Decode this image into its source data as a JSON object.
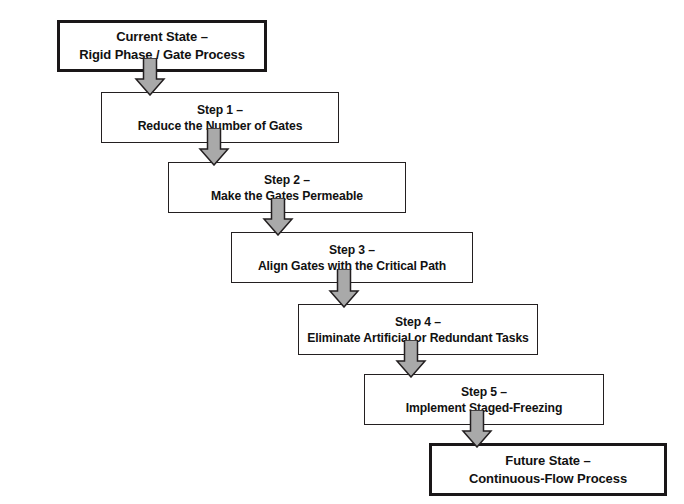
{
  "diagram": {
    "type": "flowchart",
    "orientation": "vertical-cascading",
    "title": "",
    "colors": {
      "box_border": "#231f20",
      "box_fill": "#ffffff",
      "arrow_fill": "#a9a9a9",
      "arrow_stroke": "#231f20",
      "text": "#111111",
      "background": "#ffffff"
    },
    "nodes": [
      {
        "id": "current-state",
        "emphasis": true,
        "line1": "Current State –",
        "line2": "Rigid Phase / Gate Process",
        "x": 57,
        "y": 20,
        "w": 210,
        "h": 52
      },
      {
        "id": "step-1",
        "emphasis": false,
        "line1": "Step 1 –",
        "line2": "Reduce the Number of Gates",
        "x": 101,
        "y": 92,
        "w": 238,
        "h": 51
      },
      {
        "id": "step-2",
        "emphasis": false,
        "line1": "Step 2 –",
        "line2": "Make the Gates Permeable",
        "x": 168,
        "y": 162,
        "w": 238,
        "h": 51
      },
      {
        "id": "step-3",
        "emphasis": false,
        "line1": "Step 3 –",
        "line2": "Align Gates with the Critical Path",
        "x": 231,
        "y": 232,
        "w": 242,
        "h": 51
      },
      {
        "id": "step-4",
        "emphasis": false,
        "line1": "Step 4 –",
        "line2": "Eliminate Artificial or Redundant Tasks",
        "x": 298,
        "y": 304,
        "w": 240,
        "h": 51
      },
      {
        "id": "step-5",
        "emphasis": false,
        "line1": "Step 5 –",
        "line2": "Implement Staged-Freezing",
        "x": 364,
        "y": 374,
        "w": 240,
        "h": 51
      },
      {
        "id": "future-state",
        "emphasis": true,
        "line1": "Future State –",
        "line2": "Continuous-Flow Process",
        "x": 429,
        "y": 443,
        "w": 238,
        "h": 53
      }
    ],
    "arrows": [
      {
        "id": "arrow-current-to-step1",
        "from": "current-state",
        "to": "step-1",
        "cx": 150,
        "top": 58,
        "height": 38
      },
      {
        "id": "arrow-step1-to-step2",
        "from": "step-1",
        "to": "step-2",
        "cx": 214,
        "top": 128,
        "height": 38
      },
      {
        "id": "arrow-step2-to-step3",
        "from": "step-2",
        "to": "step-3",
        "cx": 278,
        "top": 198,
        "height": 38
      },
      {
        "id": "arrow-step3-to-step4",
        "from": "step-3",
        "to": "step-4",
        "cx": 344,
        "top": 269,
        "height": 39
      },
      {
        "id": "arrow-step4-to-step5",
        "from": "step-4",
        "to": "step-5",
        "cx": 411,
        "top": 340,
        "height": 38
      },
      {
        "id": "arrow-step5-to-future",
        "from": "step-5",
        "to": "future-state",
        "cx": 477,
        "top": 410,
        "height": 38
      }
    ]
  }
}
